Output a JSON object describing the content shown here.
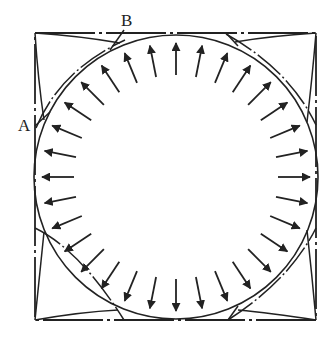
{
  "diagram": {
    "labels": {
      "A": "A",
      "B": "B"
    },
    "square": {
      "x1": 35,
      "y1": 33,
      "x2": 316,
      "y2": 320
    },
    "circle": {
      "cx": 176,
      "cy": 177,
      "r": 142
    },
    "arrows": {
      "count": 32,
      "direction": "radially-outward",
      "inner_r": 102,
      "outer_r": 134
    },
    "colors": {
      "ink": "#222222",
      "background": "#ffffff"
    }
  }
}
